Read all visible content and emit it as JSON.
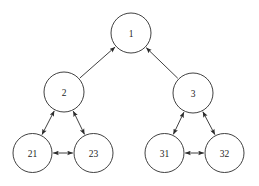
{
  "diagram": {
    "type": "directed-graph",
    "canvas": {
      "width": 259,
      "height": 186,
      "background": "#ffffff"
    },
    "style": {
      "stroke_color": "#2b2b2b",
      "node_fill": "#ffffff",
      "label_color": "#1d1d1d",
      "stroke_width": 0.9
    },
    "nodes": [
      {
        "id": "n1",
        "label": "1",
        "cx": 131,
        "cy": 33,
        "r": 20
      },
      {
        "id": "n2",
        "label": "2",
        "cx": 64,
        "cy": 92,
        "r": 20
      },
      {
        "id": "n3",
        "label": "3",
        "cx": 193,
        "cy": 93,
        "r": 20
      },
      {
        "id": "n21",
        "label": "21",
        "cx": 32.5,
        "cy": 153,
        "r": 19.5
      },
      {
        "id": "n23",
        "label": "23",
        "cx": 93.5,
        "cy": 153,
        "r": 19.5
      },
      {
        "id": "n31",
        "label": "31",
        "cx": 164.5,
        "cy": 153,
        "r": 19.5
      },
      {
        "id": "n32",
        "label": "32",
        "cx": 224.5,
        "cy": 153,
        "r": 19.5
      }
    ],
    "edges": [
      {
        "id": "e-2-1",
        "from": "n2",
        "to": "n1",
        "arrows": "single"
      },
      {
        "id": "e-3-1",
        "from": "n3",
        "to": "n1",
        "arrows": "single"
      },
      {
        "id": "e-21-2",
        "from": "n21",
        "to": "n2",
        "arrows": "double"
      },
      {
        "id": "e-23-2",
        "from": "n23",
        "to": "n2",
        "arrows": "double"
      },
      {
        "id": "e-21-23",
        "from": "n21",
        "to": "n23",
        "arrows": "double"
      },
      {
        "id": "e-31-3",
        "from": "n31",
        "to": "n3",
        "arrows": "double"
      },
      {
        "id": "e-32-3",
        "from": "n32",
        "to": "n3",
        "arrows": "double"
      },
      {
        "id": "e-31-32",
        "from": "n31",
        "to": "n32",
        "arrows": "double"
      }
    ]
  }
}
